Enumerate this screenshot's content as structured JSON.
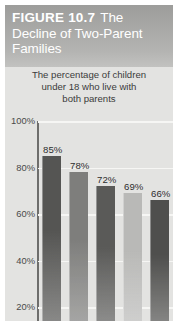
{
  "figure": {
    "label": "FIGURE 10.7",
    "title": "The Decline of Two-Parent Families",
    "title_line1_rest": "The",
    "title_line2": "Decline of Two-Parent",
    "title_line3": "Families",
    "subtitle_line1": "The percentage of children",
    "subtitle_line2": "under 18 who live with",
    "subtitle_line3": "both parents"
  },
  "colors": {
    "header_band": "#a8a8a6",
    "figure_background": "#e3e3e1",
    "gridline": "#f6f6f4",
    "axis": "#6e6e6c",
    "bar_dark": "#555553",
    "bar_medium": "#7e7e7c",
    "bar_light": "#b9b9b7",
    "label_text": "#2e2e2e"
  },
  "chart_data": {
    "type": "bar",
    "title": "The Decline of Two-Parent Families",
    "subtitle": "The percentage of children under 18 who live with both parents",
    "categories": [
      "1",
      "2",
      "3",
      "4",
      "5"
    ],
    "values": [
      85,
      78,
      72,
      69,
      66
    ],
    "data_labels": [
      "85%",
      "78%",
      "72%",
      "69%",
      "66%"
    ],
    "bar_colors": [
      "#555553",
      "#7e7e7c",
      "#5a5a58",
      "#b9b9b7",
      "#4f4f4d"
    ],
    "xlabel": "",
    "ylabel": "",
    "ylim": [
      14,
      100
    ],
    "ytick_values": [
      100,
      80,
      60,
      40,
      20
    ],
    "ytick_labels": [
      "100%",
      "80%",
      "60%",
      "40%",
      "20%"
    ],
    "grid": true,
    "legend": "none",
    "units": "percent"
  }
}
